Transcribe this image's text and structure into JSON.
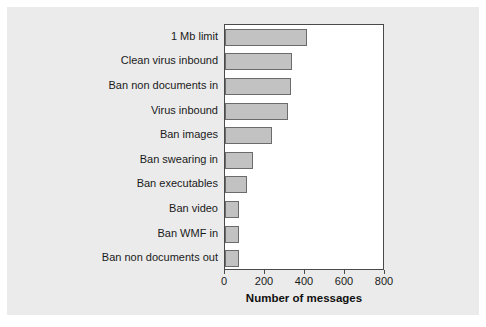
{
  "chart_data": {
    "type": "bar",
    "orientation": "horizontal",
    "title": "",
    "xlabel": "Number of messages",
    "ylabel": "",
    "xlim": [
      0,
      800
    ],
    "xticks": [
      0,
      200,
      400,
      600,
      800
    ],
    "xtick_labels": [
      "0",
      "200",
      "400",
      "600",
      "800"
    ],
    "grid": false,
    "legend": false,
    "categories": [
      "1 Mb limit",
      "Clean virus inbound",
      "Ban non documents in",
      "Virus inbound",
      "Ban images",
      "Ban swearing in",
      "Ban executables",
      "Ban video",
      "Ban WMF in",
      "Ban non documents out"
    ],
    "values": [
      410,
      335,
      330,
      315,
      235,
      140,
      110,
      70,
      70,
      70
    ],
    "colors": {
      "bar_fill": "#c2c2c2",
      "bar_border": "#6b6b6b",
      "plot_background": "#ffffff",
      "figure_background": "#ebebeb",
      "axis": "#4a4a4a",
      "text": "#1a1a1a"
    }
  }
}
